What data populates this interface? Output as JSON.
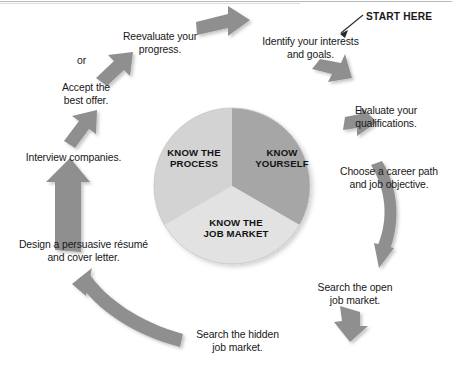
{
  "figure": {
    "type": "cycle-diagram",
    "title_note": "START HERE",
    "background": "#ffffff"
  },
  "pie": {
    "segments": [
      {
        "label_line1": "KNOW",
        "label_line2": "YOURSELF",
        "color": "#a6a6a6",
        "share": 0.3333
      },
      {
        "label_line1": "KNOW THE",
        "label_line2": "JOB MARKET",
        "color": "#e2e2e2",
        "share": 0.3333
      },
      {
        "label_line1": "KNOW THE",
        "label_line2": "PROCESS",
        "color": "#d2d2d2",
        "share": 0.3333
      }
    ]
  },
  "steps": [
    {
      "id": "step-1",
      "line1": "Identify your interests",
      "line2": "and goals."
    },
    {
      "id": "step-2",
      "line1": "Evaluate your",
      "line2": "qualifications."
    },
    {
      "id": "step-3",
      "line1": "Choose a career path",
      "line2": "and job objective."
    },
    {
      "id": "step-4",
      "line1": "Search the open",
      "line2": "job market."
    },
    {
      "id": "step-5",
      "line1": "Search the hidden",
      "line2": "job market."
    },
    {
      "id": "step-6",
      "line1": "Design a persuasive résumé",
      "line2": "and cover letter."
    },
    {
      "id": "step-7",
      "line1": "Interview companies.",
      "line2": ""
    },
    {
      "id": "step-8",
      "line1": "Accept the",
      "line2": "best offer."
    },
    {
      "id": "step-9",
      "line1": "Reevaluate your",
      "line2": "progress."
    }
  ],
  "connectors": {
    "or_label": "or"
  },
  "colors": {
    "arrow_fill": "#8f8f8f",
    "arrow_fill_light": "#9a9a9a",
    "text": "#181818",
    "pie_dark": "#a6a6a6",
    "pie_mid": "#d2d2d2",
    "pie_light": "#e2e2e2",
    "rule": "#b9b9b9"
  }
}
